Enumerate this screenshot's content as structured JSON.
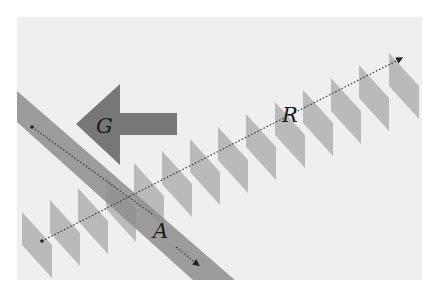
{
  "figure": {
    "labels": {
      "g": "G",
      "r": "R",
      "a": "A"
    },
    "colors": {
      "page": "#ffffff",
      "panel": "#efefef",
      "band": "#8d8d8d",
      "arrow": "#777777",
      "stripes": "#b5b5b5",
      "dotted_line": "#333333",
      "label_text": "#1a1a1a"
    },
    "elements": {
      "left_arrow": "G",
      "diagonal_band_direction_arrow": "A",
      "stripe_row_direction_arrow": "R",
      "stripe_count": 14
    }
  }
}
